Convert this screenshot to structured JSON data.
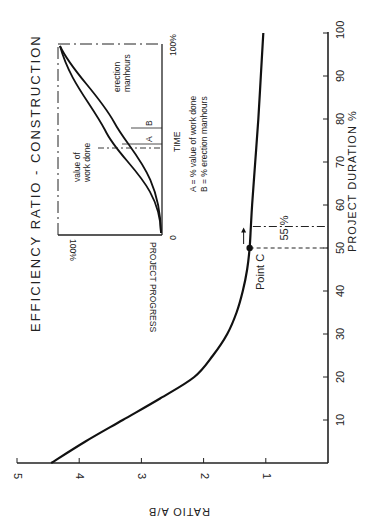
{
  "chart_data": {
    "type": "line",
    "title": "EFFICIENCY RATIO - CONSTRUCTION",
    "xlabel": "PROJECT DURATION %",
    "ylabel": "RATIO A/B",
    "xlim": [
      0,
      100
    ],
    "ylim": [
      0,
      5
    ],
    "x_ticks": [
      10,
      20,
      30,
      40,
      50,
      60,
      70,
      80,
      90,
      100
    ],
    "y_ticks": [
      1,
      2,
      3,
      4,
      5
    ],
    "grid": false,
    "series": [
      {
        "name": "Efficiency ratio A/B",
        "x": [
          0,
          5,
          10,
          15,
          20,
          25,
          30,
          35,
          40,
          45,
          50,
          55,
          60,
          70,
          80,
          90,
          100
        ],
        "values": [
          4.45,
          3.9,
          3.3,
          2.7,
          2.15,
          1.85,
          1.62,
          1.47,
          1.37,
          1.3,
          1.26,
          1.24,
          1.22,
          1.17,
          1.12,
          1.08,
          1.04
        ]
      }
    ],
    "annotations": [
      {
        "label": "Point C",
        "x": 50,
        "y": 1.26,
        "marker": "filled-circle"
      },
      {
        "label": "55 %",
        "x": 55,
        "style": "dash-dot vertical line"
      },
      {
        "label": "",
        "x": 50,
        "style": "dashed vertical line"
      }
    ],
    "inset": {
      "type": "line",
      "xlabel": "TIME",
      "ylabel": "PROJECT PROGRESS",
      "x_ticks": [
        "0",
        "100%"
      ],
      "y_ticks": [
        "100%"
      ],
      "series": [
        {
          "name": "value of work done"
        },
        {
          "name": "erection manhours"
        }
      ],
      "markers": [
        "A",
        "B"
      ],
      "legend": [
        "A = % value of work done",
        "B = % erection manhours"
      ]
    }
  },
  "labels": {
    "title": "EFFICIENCY RATIO  -  CONSTRUCTION",
    "xlabel": "PROJECT DURATION  %",
    "ylabel": "RATIO   A/B",
    "point_c": "Point C",
    "pct55": "55 %",
    "inset_time": "TIME",
    "inset_progress": "PROJECT PROGRESS",
    "inset_0": "0",
    "inset_100x": "100%",
    "inset_100y": "100%",
    "inset_value": [
      "value of",
      "work done"
    ],
    "inset_erection": [
      "erection",
      "manhours"
    ],
    "inset_A": "A",
    "inset_B": "B",
    "legend_a": "A  =  % value of work done",
    "legend_b": "B  =  % erection manhours",
    "caption_fragment": "ficiency ratio - construction"
  }
}
